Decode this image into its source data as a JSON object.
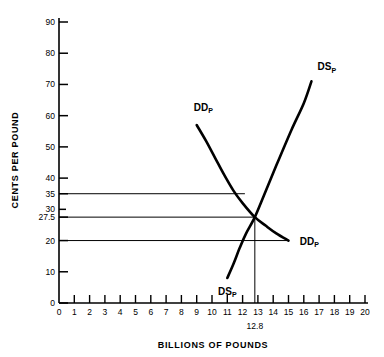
{
  "chart_data": {
    "type": "line",
    "title": "",
    "xlabel": "BILLIONS OF POUNDS",
    "ylabel": "CENTS PER POUND",
    "xlim": [
      0,
      20
    ],
    "ylim": [
      0,
      95
    ],
    "grid": false,
    "legend_position": "inline-curve-labels",
    "x_ticks": [
      0,
      1,
      2,
      3,
      4,
      5,
      6,
      7,
      8,
      9,
      10,
      11,
      12,
      13,
      14,
      15,
      16,
      17,
      18,
      19,
      20
    ],
    "x_tick_labels": [
      "0",
      "1",
      "2",
      "3",
      "4",
      "5",
      "6",
      "7",
      "8",
      "9",
      "10",
      "11",
      "12",
      "13",
      "14",
      "15",
      "16",
      "17",
      "18",
      "19",
      "20"
    ],
    "y_ticks": [
      0,
      10,
      20,
      27.5,
      30,
      35,
      40,
      50,
      60,
      70,
      80,
      90
    ],
    "y_tick_labels": [
      "0",
      "10",
      "20",
      "27.5",
      "30",
      "35",
      "40",
      "50",
      "60",
      "70",
      "80",
      "90"
    ],
    "series": [
      {
        "name": "DD_P",
        "label": "DD",
        "label_subscript": "P",
        "kind": "demand",
        "points": [
          [
            9.0,
            57.0
          ],
          [
            9.6,
            52.0
          ],
          [
            10.2,
            46.5
          ],
          [
            10.8,
            41.0
          ],
          [
            11.4,
            36.0
          ],
          [
            12.0,
            32.0
          ],
          [
            12.8,
            27.5
          ],
          [
            13.5,
            24.8
          ],
          [
            14.2,
            22.3
          ],
          [
            15.0,
            20.0
          ]
        ],
        "label_start_pos": [
          9.0,
          61.5
        ],
        "label_end_pos": [
          15.6,
          20.0
        ]
      },
      {
        "name": "DS_P",
        "label": "DS",
        "label_subscript": "P",
        "kind": "supply",
        "points": [
          [
            11.0,
            8.0
          ],
          [
            11.4,
            12.5
          ],
          [
            11.8,
            17.5
          ],
          [
            12.2,
            22.0
          ],
          [
            12.8,
            27.5
          ],
          [
            13.4,
            34.5
          ],
          [
            14.2,
            44.0
          ],
          [
            15.2,
            55.5
          ],
          [
            16.0,
            64.0
          ],
          [
            16.5,
            71.0
          ]
        ],
        "label_start_pos": [
          10.4,
          4.0
        ],
        "label_end_pos": [
          16.9,
          74.5
        ]
      }
    ],
    "reference_lines": {
      "horizontal": [
        {
          "value": 35,
          "x_from": 0,
          "x_to": 12.15
        },
        {
          "value": 27.5,
          "x_from": 0,
          "x_to": 12.8
        },
        {
          "value": 20,
          "x_from": 0,
          "x_to": 14.95
        }
      ],
      "vertical": [
        {
          "value": 12.8,
          "y_from": 0,
          "y_to": 27.5
        }
      ]
    },
    "equilibrium": {
      "x": 12.8,
      "y": 27.5,
      "x_annotation": "12.8",
      "y_annotation": "27.5"
    },
    "annotations": [
      {
        "text": "12.8",
        "x": 12.8,
        "y": -7.5
      }
    ]
  }
}
